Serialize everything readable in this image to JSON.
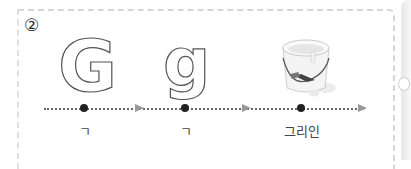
{
  "step": {
    "number": "②"
  },
  "letters": [
    {
      "char": "G",
      "style": "outline"
    },
    {
      "char": "g",
      "style": "outline"
    }
  ],
  "image": {
    "icon": "paint-bucket-icon",
    "description": "white paint bucket with brush"
  },
  "timeline": {
    "points": [
      {
        "x": 84,
        "label": "ㄱ"
      },
      {
        "x": 185,
        "label": "ㄱ"
      },
      {
        "x": 301,
        "label": "그리인"
      }
    ],
    "arrows": [
      {
        "x": 135
      },
      {
        "x": 242
      },
      {
        "x": 360
      }
    ]
  },
  "colors": {
    "border": "#d6d6d6",
    "dot": "#222222",
    "arrow": "#999999",
    "text": "#444444"
  }
}
